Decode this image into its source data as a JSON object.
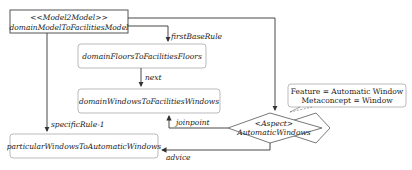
{
  "diagram": {
    "nodes": {
      "model2model": {
        "stereotype": "<<Model2Model>>",
        "name": "domainModelToFacilitiesModel"
      },
      "floors": {
        "name": "domainFloorsToFacilitiesFloors"
      },
      "windows": {
        "name": "domainWindowsToFacilitiesWindows"
      },
      "particular": {
        "name": "particularWindowsToAutomaticWindows"
      },
      "aspect": {
        "stereotype": "<Aspect>",
        "name": "AutomaticWindows"
      },
      "note": {
        "line1": "Feature = Automatic Window",
        "line2": "Metaconcept = Window"
      }
    },
    "edges": {
      "firstBaseRule": "firstBaseRule",
      "next": "next",
      "specificRule": "specificRule-1",
      "joinpoint": "joinpoint",
      "advice": "advice"
    }
  }
}
